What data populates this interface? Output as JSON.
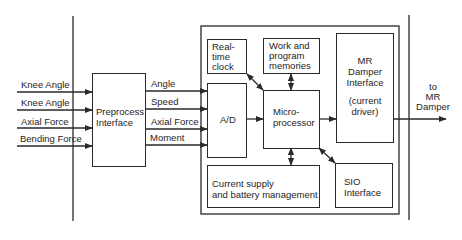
{
  "diagram": {
    "type": "block-diagram",
    "inputs": [
      {
        "label": "Knee Angle"
      },
      {
        "label": "Knee Angle"
      },
      {
        "label": "Axial Force"
      },
      {
        "label": "Bending Force"
      }
    ],
    "preprocess": {
      "line1": "Preprocess",
      "line2": "Interface"
    },
    "signals": [
      {
        "label": "Angle"
      },
      {
        "label": "Speed"
      },
      {
        "label": "Axial Force"
      },
      {
        "label": "Moment"
      }
    ],
    "blocks": {
      "rtc": {
        "line1": "Real-",
        "line2": "time",
        "line3": "clock"
      },
      "memory": {
        "line1": "Work and",
        "line2": "program",
        "line3": "memories"
      },
      "adc": {
        "label": "A/D"
      },
      "cpu": {
        "line1": "Micro-",
        "line2": "processor"
      },
      "mr_interface": {
        "line1": "MR",
        "line2": "Damper",
        "line3": "Interface",
        "line4": "(current",
        "line5": "driver)"
      },
      "power": {
        "line1": "Current supply",
        "line2": "and battery management"
      },
      "sio": {
        "line1": "SIO",
        "line2": "Interface"
      }
    },
    "output": {
      "line1": "to",
      "line2": "MR",
      "line3": "Damper"
    },
    "colors": {
      "line": "#2a2a2a",
      "background": "#ffffff"
    }
  }
}
